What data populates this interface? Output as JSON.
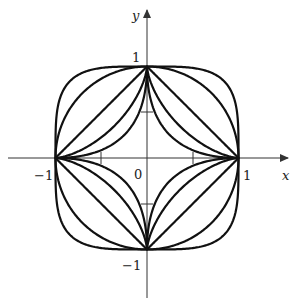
{
  "figure": {
    "axes": {
      "x_label": "x",
      "y_label": "y",
      "origin_label": "0",
      "x_ticks": [
        {
          "value": -1,
          "label": "−1"
        },
        {
          "value": 1,
          "label": "1"
        }
      ],
      "y_ticks": [
        {
          "value": 1,
          "label": "1"
        },
        {
          "value": -1,
          "label": "−1"
        }
      ]
    },
    "curves": [
      {
        "name": "superellipse",
        "equation": "|x|^p + |y|^p = 1",
        "p": 0.5
      },
      {
        "name": "astroid",
        "equation": "|x|^(2/3) + |y|^(2/3) = 1",
        "p": 0.6667
      },
      {
        "name": "diamond",
        "equation": "|x| + |y| = 1",
        "p": 1
      },
      {
        "name": "circle",
        "equation": "x^2 + y^2 = 1",
        "p": 2
      },
      {
        "name": "squircle",
        "equation": "x^4 + y^4 = 1",
        "p": 4
      }
    ],
    "colors": {
      "stroke": "#111111",
      "axis": "#333333",
      "background": "#ffffff"
    }
  }
}
